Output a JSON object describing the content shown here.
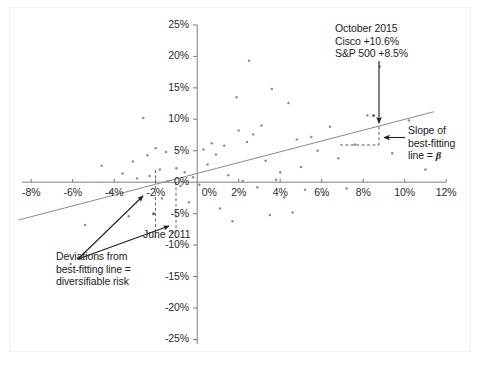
{
  "chart_data": {
    "type": "scatter",
    "title": "",
    "xlabel": "",
    "ylabel": "",
    "xlim": [
      -9.0,
      12.8
    ],
    "ylim": [
      -27.0,
      26.5
    ],
    "grid": false,
    "legend": "none",
    "x_ticks": [
      "-8%",
      "-6%",
      "-4%",
      "-2%",
      "0%",
      "2%",
      "4%",
      "6%",
      "8%",
      "10%",
      "12%"
    ],
    "x_tick_values": [
      -8,
      -6,
      -4,
      -2,
      0,
      2,
      4,
      6,
      8,
      10,
      12
    ],
    "y_ticks": [
      "25%",
      "20%",
      "15%",
      "10%",
      "5%",
      "0%",
      "-5%",
      "-10%",
      "-15%",
      "-20%",
      "-25%"
    ],
    "y_tick_values": [
      25,
      20,
      15,
      10,
      5,
      0,
      -5,
      -10,
      -15,
      -20,
      -25
    ],
    "points": [
      [
        -6.1,
        -13.0
      ],
      [
        -5.4,
        -6.8
      ],
      [
        -4.6,
        2.6
      ],
      [
        -4.2,
        -1.6
      ],
      [
        -3.6,
        1.4
      ],
      [
        -3.3,
        -5.4
      ],
      [
        -3.1,
        3.3
      ],
      [
        -2.9,
        0.6
      ],
      [
        -2.6,
        10.2
      ],
      [
        -2.4,
        4.3
      ],
      [
        -2.3,
        1.0
      ],
      [
        -2.1,
        -5.0
      ],
      [
        -2.0,
        5.4
      ],
      [
        -1.8,
        2.0
      ],
      [
        -1.7,
        -2.6
      ],
      [
        -1.5,
        4.8
      ],
      [
        -1.4,
        0.2
      ],
      [
        -1.2,
        -8.0
      ],
      [
        -1.0,
        2.2
      ],
      [
        -0.8,
        -0.6
      ],
      [
        -0.6,
        1.6
      ],
      [
        -0.4,
        -3.2
      ],
      [
        -0.2,
        0.8
      ],
      [
        0.1,
        -0.4
      ],
      [
        0.3,
        5.2
      ],
      [
        0.5,
        2.8
      ],
      [
        0.7,
        6.2
      ],
      [
        0.9,
        4.4
      ],
      [
        1.1,
        -4.2
      ],
      [
        1.3,
        5.8
      ],
      [
        1.5,
        1.1
      ],
      [
        1.7,
        -6.2
      ],
      [
        1.9,
        13.5
      ],
      [
        2.0,
        8.2
      ],
      [
        2.2,
        0.2
      ],
      [
        2.4,
        6.4
      ],
      [
        2.5,
        19.3
      ],
      [
        2.7,
        7.6
      ],
      [
        2.9,
        -0.8
      ],
      [
        3.1,
        9.0
      ],
      [
        3.3,
        3.4
      ],
      [
        3.5,
        -5.2
      ],
      [
        3.6,
        14.8
      ],
      [
        3.8,
        0.4
      ],
      [
        4.0,
        1.6
      ],
      [
        4.2,
        -2.4
      ],
      [
        4.4,
        12.6
      ],
      [
        4.6,
        -4.8
      ],
      [
        4.8,
        6.8
      ],
      [
        5.0,
        2.4
      ],
      [
        5.2,
        -1.2
      ],
      [
        5.5,
        7.2
      ],
      [
        5.8,
        5.0
      ],
      [
        6.1,
        -2.0
      ],
      [
        6.4,
        8.8
      ],
      [
        6.8,
        3.8
      ],
      [
        7.2,
        -1.0
      ],
      [
        7.6,
        6.0
      ],
      [
        8.2,
        10.6
      ],
      [
        8.8,
        18.4
      ],
      [
        9.4,
        4.6
      ],
      [
        10.2,
        9.8
      ],
      [
        11.0,
        2.0
      ]
    ],
    "best_fit_line": {
      "label": "best-fitting line",
      "x_start": -8.6,
      "y_start": -6.0,
      "x_end": 11.4,
      "y_end": 11.2,
      "slope_symbol": "β"
    },
    "highlighted_points": [
      {
        "name": "october-2015",
        "x": 8.5,
        "y": 10.6
      },
      {
        "name": "june-2011",
        "x": -2.1,
        "y": -5.0
      }
    ]
  },
  "annotations": {
    "october_2015": {
      "line1": "October 2015",
      "line2": "Cisco +10.6%",
      "line3": "S&P 500 +8.5%"
    },
    "slope": {
      "line1": "Slope of",
      "line2": "best-fitting",
      "line3_prefix": "line = ",
      "line3_symbol": "β"
    },
    "june_2011": {
      "label": "June 2011"
    },
    "deviations": {
      "line1": "Deviations from",
      "line2": "best-fitting line =",
      "line3": "diversifiable risk"
    }
  }
}
